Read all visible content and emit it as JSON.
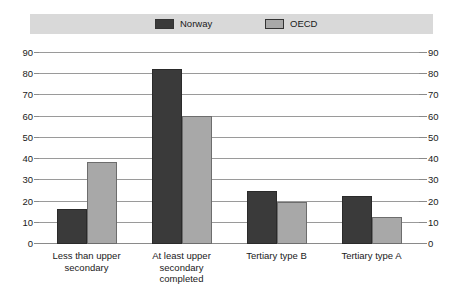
{
  "legend": {
    "entries": [
      {
        "label": "Norway",
        "color": "#3a3a3a",
        "icon": "legend-swatch-icon"
      },
      {
        "label": "OECD",
        "color": "#a8a8a8",
        "icon": "legend-swatch-icon"
      }
    ],
    "band_color": "#d9d9d9"
  },
  "axis": {
    "left_ticks": [
      "90",
      "80",
      "70",
      "60",
      "50",
      "40",
      "30",
      "20",
      "10",
      "0"
    ],
    "right_ticks": [
      "90",
      "80",
      "70",
      "60",
      "50",
      "40",
      "30",
      "20",
      "10",
      "0"
    ]
  },
  "categories": [
    {
      "lines": [
        "Less than upper",
        "secondary"
      ]
    },
    {
      "lines": [
        "At least upper",
        "secondary",
        "completed"
      ]
    },
    {
      "lines": [
        "Tertiary type B"
      ]
    },
    {
      "lines": [
        "Tertiary type A"
      ]
    }
  ],
  "chart_data": {
    "type": "bar",
    "title": "",
    "subtitle": "",
    "xlabel": "",
    "ylabel": "",
    "categories": [
      "Less than upper secondary",
      "At least upper secondary completed",
      "Tertiary type B",
      "Tertiary type A"
    ],
    "series": [
      {
        "name": "Norway",
        "color": "#3a3a3a",
        "values": [
          16.5,
          82.5,
          25.0,
          22.5
        ]
      },
      {
        "name": "OECD",
        "color": "#a8a8a8",
        "values": [
          38.5,
          60.5,
          20.0,
          12.5
        ]
      }
    ],
    "ylim": [
      0,
      90
    ],
    "ytick_step": 10,
    "ytick_labels": [
      "0",
      "10",
      "20",
      "30",
      "40",
      "50",
      "60",
      "70",
      "80",
      "90"
    ],
    "dual_axis": true,
    "grid": true,
    "grid_axis": "y",
    "legend_position": "top"
  }
}
